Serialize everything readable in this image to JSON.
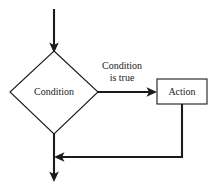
{
  "diagram": {
    "background_color": "#ffffff",
    "line_color": "#1a1a1a",
    "shape_fill": "#ffffff",
    "nodes": [
      {
        "id": "condition",
        "type": "decision",
        "label": "Condition",
        "shape": "diamond"
      },
      {
        "id": "action",
        "type": "process",
        "label": "Action",
        "shape": "rectangle"
      }
    ],
    "edges": [
      {
        "id": "entry",
        "from": "",
        "to": "condition",
        "label": "",
        "direction": "down"
      },
      {
        "id": "true-branch",
        "from": "condition",
        "to": "action",
        "label_line1": "Condition",
        "label_line2": "is true",
        "direction": "right"
      },
      {
        "id": "loop-back",
        "from": "action",
        "to": "exit-path",
        "label": "",
        "direction": "left"
      },
      {
        "id": "exit",
        "from": "condition",
        "to": "",
        "label": "",
        "direction": "down"
      }
    ]
  }
}
